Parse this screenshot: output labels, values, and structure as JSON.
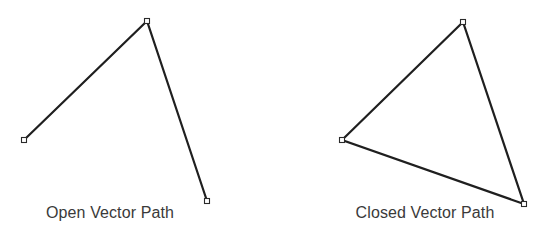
{
  "diagram": {
    "open_path": {
      "label": "Open Vector Path",
      "label_center_x": 110,
      "closed": false,
      "anchors": [
        {
          "x": 24,
          "y": 140
        },
        {
          "x": 147,
          "y": 21
        },
        {
          "x": 207,
          "y": 201
        }
      ]
    },
    "closed_path": {
      "label": "Closed Vector Path",
      "label_center_x": 425,
      "closed": true,
      "anchors": [
        {
          "x": 342,
          "y": 140
        },
        {
          "x": 463,
          "y": 22
        },
        {
          "x": 524,
          "y": 204
        }
      ]
    },
    "colors": {
      "stroke": "#1f1f1f",
      "anchor_fill": "#ffffff",
      "anchor_stroke": "#2a2a2a",
      "label": "#3a3a3a",
      "background": "#ffffff"
    },
    "anchor_size": 5
  }
}
